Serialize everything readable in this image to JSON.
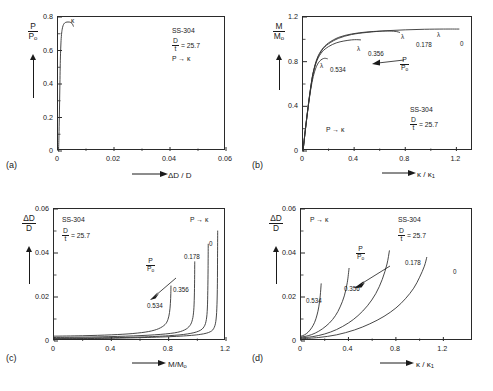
{
  "figure": {
    "material": "SS-304",
    "dt_value": "= 25.7",
    "path": "P → κ",
    "panel_labels": [
      "(a)",
      "(b)",
      "(c)",
      "(d)"
    ]
  },
  "symbols": {
    "P": "P",
    "P0": "P",
    "M": "M",
    "M0": "M",
    "o_sub": "o",
    "D": "D",
    "t": "t",
    "deltaD": "ΔD",
    "kappa": "κ",
    "kappa1": "κ",
    "one_sub": "1",
    "lambda": "λ"
  },
  "chart_data": [
    {
      "id": "a",
      "type": "line",
      "title": "",
      "xlabel": "ΔD / D",
      "ylabel": "P/Pₒ",
      "xlim": [
        0,
        0.06
      ],
      "ylim": [
        0,
        0.8
      ],
      "xticks": [
        "0",
        "0.02",
        "0.04",
        "0.06"
      ],
      "xtickvals": [
        0,
        0.02,
        0.04,
        0.06
      ],
      "yticks": [
        "0",
        "0.2",
        "0.4",
        "0.6",
        "0.8"
      ],
      "ytickvals": [
        0,
        0.2,
        0.4,
        0.6,
        0.8
      ],
      "grid": false,
      "annotations": [
        "SS-304",
        "D/t = 25.7",
        "P → κ"
      ],
      "marker_label": "κ",
      "series": [
        {
          "name": "pressurization",
          "points": [
            [
              0.0002,
              0
            ],
            [
              0.00035,
              0.09
            ],
            [
              0.00048,
              0.2
            ],
            [
              0.00058,
              0.3
            ],
            [
              0.00068,
              0.4
            ],
            [
              0.00078,
              0.5
            ],
            [
              0.0009,
              0.58
            ],
            [
              0.00105,
              0.645
            ],
            [
              0.00125,
              0.695
            ],
            [
              0.0015,
              0.727
            ],
            [
              0.0018,
              0.748
            ],
            [
              0.00215,
              0.76
            ],
            [
              0.0026,
              0.767
            ],
            [
              0.0032,
              0.77
            ],
            [
              0.004,
              0.77
            ],
            [
              0.0047,
              0.766
            ],
            [
              0.0052,
              0.757
            ],
            [
              0.00548,
              0.745
            ]
          ]
        }
      ]
    },
    {
      "id": "b",
      "type": "line",
      "title": "",
      "xlabel": "κ / κ₁",
      "ylabel": "M/Mₒ",
      "xlim": [
        0,
        1.33
      ],
      "ylim": [
        0,
        1.2
      ],
      "xticks": [
        "0",
        "0.4",
        "0.8",
        "1.2"
      ],
      "xtickvals": [
        0,
        0.4,
        0.8,
        1.2
      ],
      "yticks": [
        "0",
        "0.4",
        "0.8",
        "1.2"
      ],
      "ytickvals": [
        0,
        0.4,
        0.8,
        1.2
      ],
      "grid": false,
      "annotations": [
        "P → κ",
        "SS-304",
        "D/t = 25.7"
      ],
      "arrow_label": "P/Pₒ",
      "series": [
        {
          "name": "0",
          "label": "0",
          "lambda_mark": true,
          "points": [
            [
              0,
              0
            ],
            [
              0.02,
              0.2
            ],
            [
              0.04,
              0.39
            ],
            [
              0.06,
              0.56
            ],
            [
              0.08,
              0.7
            ],
            [
              0.11,
              0.82
            ],
            [
              0.15,
              0.905
            ],
            [
              0.2,
              0.96
            ],
            [
              0.28,
              1.01
            ],
            [
              0.38,
              1.043
            ],
            [
              0.5,
              1.062
            ],
            [
              0.65,
              1.077
            ],
            [
              0.8,
              1.085
            ],
            [
              0.95,
              1.09
            ],
            [
              1.1,
              1.092
            ],
            [
              1.22,
              1.092
            ]
          ]
        },
        {
          "name": "0.178",
          "label": "0.178",
          "lambda_mark": true,
          "points": [
            [
              0,
              0
            ],
            [
              0.02,
              0.205
            ],
            [
              0.04,
              0.395
            ],
            [
              0.06,
              0.565
            ],
            [
              0.08,
              0.705
            ],
            [
              0.11,
              0.828
            ],
            [
              0.15,
              0.912
            ],
            [
              0.2,
              0.968
            ],
            [
              0.28,
              1.018
            ],
            [
              0.38,
              1.048
            ],
            [
              0.5,
              1.066
            ],
            [
              0.6,
              1.073
            ],
            [
              0.68,
              1.074
            ],
            [
              0.73,
              1.07
            ],
            [
              0.755,
              1.062
            ]
          ]
        },
        {
          "name": "0.356",
          "label": "0.356",
          "lambda_mark": true,
          "points": [
            [
              0,
              0
            ],
            [
              0.02,
              0.21
            ],
            [
              0.04,
              0.4
            ],
            [
              0.06,
              0.57
            ],
            [
              0.08,
              0.7
            ],
            [
              0.11,
              0.812
            ],
            [
              0.15,
              0.888
            ],
            [
              0.2,
              0.935
            ],
            [
              0.26,
              0.968
            ],
            [
              0.32,
              0.985
            ],
            [
              0.38,
              0.995
            ],
            [
              0.42,
              0.997
            ],
            [
              0.45,
              0.995
            ]
          ]
        },
        {
          "name": "0.534",
          "label": "0.534",
          "lambda_mark": true,
          "points": [
            [
              0,
              0
            ],
            [
              0.02,
              0.205
            ],
            [
              0.04,
              0.39
            ],
            [
              0.06,
              0.548
            ],
            [
              0.08,
              0.665
            ],
            [
              0.1,
              0.742
            ],
            [
              0.12,
              0.789
            ],
            [
              0.14,
              0.815
            ],
            [
              0.16,
              0.828
            ],
            [
              0.175,
              0.83
            ],
            [
              0.19,
              0.826
            ]
          ]
        }
      ]
    },
    {
      "id": "c",
      "type": "line",
      "title": "",
      "xlabel": "M/Mₒ",
      "ylabel": "ΔD/D",
      "xlim": [
        0,
        1.2
      ],
      "ylim": [
        0,
        0.06
      ],
      "xticks": [
        "0",
        "0.4",
        "0.8",
        "1.2"
      ],
      "xtickvals": [
        0,
        0.4,
        0.8,
        1.2
      ],
      "yticks": [
        "0",
        "0.02",
        "0.04",
        "0.06"
      ],
      "ytickvals": [
        0,
        0.02,
        0.04,
        0.06
      ],
      "grid": false,
      "annotations": [
        "SS-304",
        "D/t = 25.7",
        "P → κ"
      ],
      "arrow_label": "P/Pₒ",
      "series": [
        {
          "name": "0.534",
          "label": "0.534",
          "points": [
            [
              0,
              0.0022
            ],
            [
              0.2,
              0.0024
            ],
            [
              0.4,
              0.0028
            ],
            [
              0.55,
              0.0034
            ],
            [
              0.66,
              0.0043
            ],
            [
              0.73,
              0.0056
            ],
            [
              0.775,
              0.0075
            ],
            [
              0.795,
              0.0098
            ],
            [
              0.806,
              0.013
            ],
            [
              0.812,
              0.017
            ],
            [
              0.815,
              0.0215
            ],
            [
              0.816,
              0.025
            ]
          ]
        },
        {
          "name": "0.356",
          "label": "0.356",
          "points": [
            [
              0,
              0.0016
            ],
            [
              0.25,
              0.0018
            ],
            [
              0.5,
              0.0022
            ],
            [
              0.7,
              0.0028
            ],
            [
              0.84,
              0.0037
            ],
            [
              0.91,
              0.005
            ],
            [
              0.948,
              0.007
            ],
            [
              0.966,
              0.0098
            ],
            [
              0.975,
              0.014
            ],
            [
              0.979,
              0.02
            ],
            [
              0.981,
              0.028
            ],
            [
              0.982,
              0.036
            ]
          ]
        },
        {
          "name": "0.178",
          "label": "0.178",
          "points": [
            [
              0,
              0.0012
            ],
            [
              0.3,
              0.0014
            ],
            [
              0.6,
              0.0018
            ],
            [
              0.8,
              0.0024
            ],
            [
              0.93,
              0.0032
            ],
            [
              1.01,
              0.0045
            ],
            [
              1.047,
              0.0065
            ],
            [
              1.063,
              0.0098
            ],
            [
              1.07,
              0.015
            ],
            [
              1.073,
              0.023
            ],
            [
              1.075,
              0.033
            ],
            [
              1.076,
              0.044
            ]
          ]
        },
        {
          "name": "0",
          "label": "0",
          "points": [
            [
              0,
              0.001
            ],
            [
              0.35,
              0.0012
            ],
            [
              0.65,
              0.0016
            ],
            [
              0.88,
              0.0022
            ],
            [
              1.02,
              0.003
            ],
            [
              1.09,
              0.0042
            ],
            [
              1.118,
              0.0062
            ],
            [
              1.131,
              0.01
            ],
            [
              1.137,
              0.0165
            ],
            [
              1.14,
              0.026
            ],
            [
              1.141,
              0.038
            ],
            [
              1.142,
              0.05
            ]
          ]
        }
      ]
    },
    {
      "id": "d",
      "type": "line",
      "title": "",
      "xlabel": "κ / κ₁",
      "ylabel": "ΔD/D",
      "xlim": [
        0,
        1.45
      ],
      "ylim": [
        0,
        0.06
      ],
      "xticks": [
        "0",
        "0.4",
        "0.8",
        "1.2"
      ],
      "xtickvals": [
        0,
        0.4,
        0.8,
        1.2
      ],
      "yticks": [
        "0",
        "0.02",
        "0.04",
        "0.06"
      ],
      "ytickvals": [
        0,
        0.02,
        0.04,
        0.06
      ],
      "grid": false,
      "annotations": [
        "P → κ",
        "SS-304",
        "D/t = 25.7"
      ],
      "arrow_label": "P/Pₒ",
      "series": [
        {
          "name": "0.534",
          "label": "0.534",
          "points": [
            [
              0,
              0.0022
            ],
            [
              0.03,
              0.0028
            ],
            [
              0.06,
              0.004
            ],
            [
              0.09,
              0.006
            ],
            [
              0.115,
              0.0085
            ],
            [
              0.135,
              0.0118
            ],
            [
              0.15,
              0.0155
            ],
            [
              0.162,
              0.0205
            ],
            [
              0.17,
              0.026
            ]
          ]
        },
        {
          "name": "0.356",
          "label": "0.356",
          "points": [
            [
              0,
              0.0018
            ],
            [
              0.06,
              0.0024
            ],
            [
              0.12,
              0.0036
            ],
            [
              0.18,
              0.0055
            ],
            [
              0.24,
              0.0082
            ],
            [
              0.29,
              0.0115
            ],
            [
              0.33,
              0.0155
            ],
            [
              0.365,
              0.0205
            ],
            [
              0.39,
              0.0265
            ],
            [
              0.405,
              0.033
            ]
          ]
        },
        {
          "name": "0.178",
          "label": "0.178",
          "points": [
            [
              0,
              0.0014
            ],
            [
              0.1,
              0.002
            ],
            [
              0.2,
              0.0032
            ],
            [
              0.3,
              0.0052
            ],
            [
              0.4,
              0.0082
            ],
            [
              0.48,
              0.0115
            ],
            [
              0.56,
              0.016
            ],
            [
              0.63,
              0.0215
            ],
            [
              0.685,
              0.028
            ],
            [
              0.725,
              0.035
            ],
            [
              0.745,
              0.041
            ]
          ]
        },
        {
          "name": "0",
          "label": "0",
          "points": [
            [
              0,
              0.001
            ],
            [
              0.15,
              0.0016
            ],
            [
              0.3,
              0.0028
            ],
            [
              0.45,
              0.005
            ],
            [
              0.58,
              0.0078
            ],
            [
              0.7,
              0.0112
            ],
            [
              0.8,
              0.015
            ],
            [
              0.88,
              0.0192
            ],
            [
              0.95,
              0.024
            ],
            [
              1.0,
              0.029
            ],
            [
              1.04,
              0.034
            ],
            [
              1.06,
              0.038
            ]
          ]
        }
      ]
    }
  ]
}
